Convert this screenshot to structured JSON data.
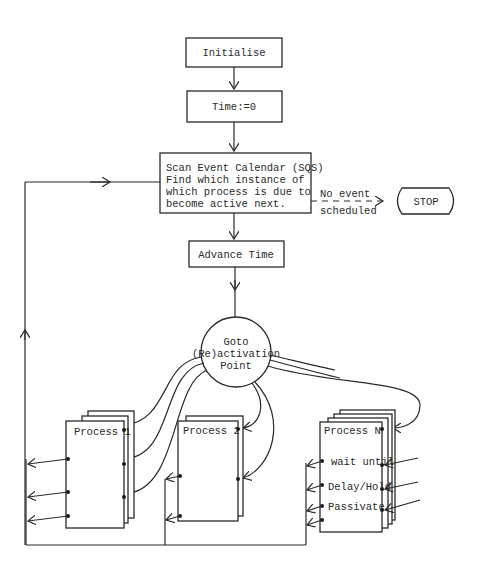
{
  "diagram": {
    "nodes": {
      "initialise": "Initialise",
      "time_zero": "Time:=0",
      "scan": {
        "line1": "Scan Event Calendar (SQS)",
        "line2": "Find which instance of",
        "line3": "which process is due to",
        "line4": "become active next."
      },
      "advance": "Advance Time",
      "goto": {
        "line1": "Goto",
        "line2": "(Re)activation",
        "line3": "Point"
      },
      "stop": "STOP",
      "process1": "Process 1",
      "process2": "Process 2",
      "processN": "Process N"
    },
    "edges": {
      "no_event_line1": "No event",
      "no_event_line2": "scheduled"
    },
    "processN_statements": [
      "wait until",
      "Delay/Hold",
      "Passivate"
    ],
    "colors": {
      "ink": "#2a2a2a",
      "background": "#ffffff"
    }
  }
}
